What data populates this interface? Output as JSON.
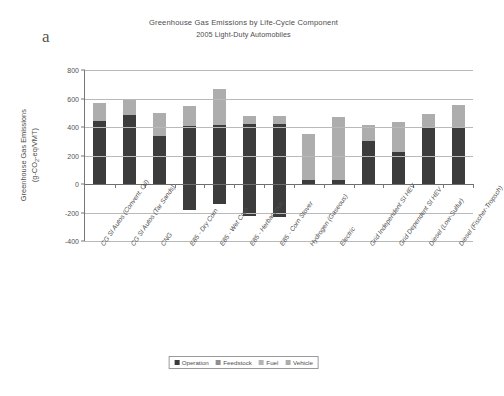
{
  "panel": {
    "letter": "a"
  },
  "chart_data": {
    "type": "bar",
    "subtype": "stacked",
    "title": "Greenhouse Gas Emissions by Life-Cycle Component",
    "subtitle": "2005 Light-Duty Automobiles",
    "xlabel": "",
    "ylabel": "Greenhouse Gas Emissions (g-CO2-eq/VMT)",
    "ylabel_parts": {
      "line1": "Greenhouse Gas Emissions",
      "line2_pre": "(g-CO",
      "line2_sub": "2",
      "line2_post": "-eq/VMT)"
    },
    "ylim": [
      -400,
      800
    ],
    "yticks": [
      800,
      600,
      400,
      200,
      0,
      -200,
      -400
    ],
    "grid": "horizontal",
    "legend_position": "bottom",
    "categories": [
      "CG SI Autos (Convent. Oil)",
      "CG SI Autos (Tar Sands)",
      "CNG",
      "E85 - Dry Corn",
      "E85 - Wet Corn",
      "E85 - Herbaceous",
      "E85 - Corn Stover",
      "Hydrogen (Gaseous)",
      "Electric",
      "Grid Independent SI HEV",
      "Grid Dependent SI HEV",
      "Diesel (Low-Sulfur)",
      "Diesel (Fischer-Tropsch)"
    ],
    "series": [
      {
        "name": "Operation",
        "color": "#3c3c3c",
        "values": [
          445,
          485,
          340,
          405,
          415,
          420,
          420,
          30,
          30,
          305,
          225,
          395,
          390
        ]
      },
      {
        "name": "Feedstock",
        "color": "#8f8f8f",
        "values": [
          0,
          0,
          0,
          -185,
          -140,
          -225,
          -230,
          0,
          0,
          0,
          0,
          0,
          0
        ]
      },
      {
        "name": "Fuel",
        "color": "#b5b5b5",
        "values": [
          0,
          0,
          0,
          0,
          0,
          0,
          0,
          0,
          0,
          0,
          0,
          0,
          0
        ]
      },
      {
        "name": "Vehicle",
        "color": "#adadad",
        "values": [
          120,
          115,
          160,
          140,
          255,
          60,
          60,
          320,
          440,
          110,
          210,
          95,
          165
        ]
      }
    ],
    "legend": [
      "Operation",
      "Feedstock",
      "Fuel",
      "Vehicle"
    ]
  }
}
